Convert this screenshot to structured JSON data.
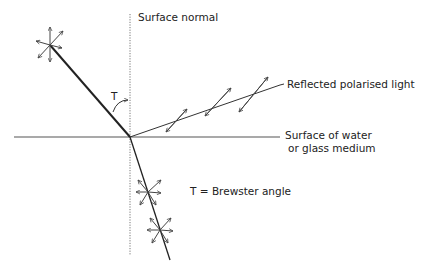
{
  "diagram": {
    "labels": {
      "surface_normal": "Surface normal",
      "angle_symbol": "T",
      "reflected": "Reflected polarised light",
      "surface_line1": "Surface of water",
      "surface_line2": "or glass medium",
      "legend": "T = Brewster angle"
    },
    "colors": {
      "background": "#ffffff",
      "line": "#222222",
      "surface": "#555555",
      "normal": "#777777",
      "arrows": "#444444",
      "text": "#222222"
    },
    "elements": {
      "incident_ray": {
        "from": [
          50,
          45
        ],
        "to": [
          130,
          137
        ]
      },
      "reflected_ray": {
        "from": [
          130,
          137
        ],
        "to": [
          280,
          85
        ]
      },
      "refracted_ray": {
        "from": [
          130,
          137
        ],
        "to": [
          170,
          260
        ]
      },
      "surface": {
        "from": [
          14,
          137
        ],
        "to": [
          280,
          137
        ]
      },
      "normal": {
        "from": [
          130,
          14
        ],
        "to": [
          130,
          255
        ]
      },
      "incident_polarisation_star": {
        "center": [
          50,
          45
        ],
        "type": "unpolarised"
      },
      "reflected_polarisation_arrows": [
        [
          177,
          120
        ],
        [
          218,
          100
        ],
        [
          258,
          83
        ]
      ],
      "refracted_polarisation_stars": [
        [
          148,
          188
        ],
        [
          160,
          228
        ]
      ]
    }
  }
}
